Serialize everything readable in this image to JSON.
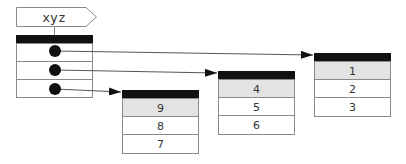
{
  "diagram": {
    "label": "xyz",
    "pointer_array": {
      "slots": 3
    },
    "arrays": [
      {
        "id": "array-a",
        "values": [
          "1",
          "2",
          "3"
        ]
      },
      {
        "id": "array-b",
        "values": [
          "4",
          "5",
          "6"
        ]
      },
      {
        "id": "array-c",
        "values": [
          "9",
          "8",
          "7"
        ]
      }
    ],
    "colors": {
      "header": "#111111",
      "first_row": "#e3e3e3",
      "border": "#8a8a8a",
      "line": "#555555",
      "dot": "#111111"
    }
  }
}
